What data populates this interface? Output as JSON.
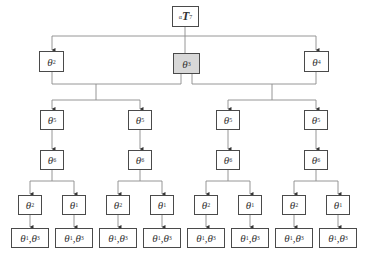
{
  "diagram": {
    "type": "tree",
    "root": {
      "prefix": "α",
      "symbol": "T",
      "sub": "7"
    },
    "level1": [
      {
        "symbol": "θ",
        "sub": "2",
        "shaded": false
      },
      {
        "symbol": "θ",
        "sub": "3",
        "shaded": true
      },
      {
        "symbol": "θ",
        "sub": "4",
        "shaded": false
      }
    ],
    "level2": [
      {
        "symbol": "θ",
        "sub": "5"
      },
      {
        "symbol": "θ",
        "sub": "5"
      },
      {
        "symbol": "θ",
        "sub": "5"
      },
      {
        "symbol": "θ",
        "sub": "5"
      }
    ],
    "level3": [
      {
        "symbol": "θ",
        "sub": "6"
      },
      {
        "symbol": "θ",
        "sub": "6"
      },
      {
        "symbol": "θ",
        "sub": "6"
      },
      {
        "symbol": "θ",
        "sub": "6"
      }
    ],
    "level4": [
      {
        "symbol": "θ",
        "sub": "2"
      },
      {
        "symbol": "θ",
        "sub": "1"
      },
      {
        "symbol": "θ",
        "sub": "2"
      },
      {
        "symbol": "θ",
        "sub": "1"
      },
      {
        "symbol": "θ",
        "sub": "2"
      },
      {
        "symbol": "θ",
        "sub": "1"
      },
      {
        "symbol": "θ",
        "sub": "2"
      },
      {
        "symbol": "θ",
        "sub": "1"
      }
    ],
    "level5": [
      {
        "a": "θ",
        "a_sub": "1",
        "sep": ",",
        "b": "θ",
        "b_sub": "3"
      },
      {
        "a": "θ",
        "a_sub": "1",
        "sep": ",",
        "b": "θ",
        "b_sub": "3"
      },
      {
        "a": "θ",
        "a_sub": "1",
        "sep": ",",
        "b": "θ",
        "b_sub": "3"
      },
      {
        "a": "θ",
        "a_sub": "1",
        "sep": ",",
        "b": "θ",
        "b_sub": "3"
      },
      {
        "a": "θ",
        "a_sub": "1",
        "sep": ",",
        "b": "θ",
        "b_sub": "3"
      },
      {
        "a": "θ",
        "a_sub": "1",
        "sep": ",",
        "b": "θ",
        "b_sub": "3"
      },
      {
        "a": "θ",
        "a_sub": "1",
        "sep": ",",
        "b": "θ",
        "b_sub": "3"
      },
      {
        "a": "θ",
        "a_sub": "1",
        "sep": ",",
        "b": "θ",
        "b_sub": "3"
      }
    ],
    "colors": {
      "line": "#8a8a8a",
      "border": "#4a4a4a",
      "shaded_fill": "#d8d8d8"
    }
  }
}
